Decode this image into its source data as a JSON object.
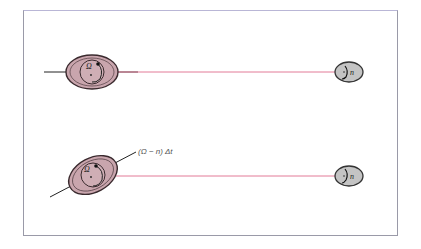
{
  "diagram": {
    "type": "tidal-bulge-schematic",
    "colors": {
      "planet_fill": "#c9a5ad",
      "planet_stroke": "#3a2a2e",
      "moon_fill": "#c4c4c4",
      "moon_stroke": "#333333",
      "connector": "#e27a97",
      "axis_line": "#222222",
      "frame": "#9a9aa8"
    },
    "panels": [
      {
        "id": "top",
        "planet_label": "Ω",
        "moon_label": "n",
        "bulge_axis_tilted": false
      },
      {
        "id": "bottom",
        "planet_label": "Ω",
        "moon_label": "n",
        "bulge_axis_tilted": true,
        "annotation": "(Ω − n) Δt"
      }
    ]
  }
}
